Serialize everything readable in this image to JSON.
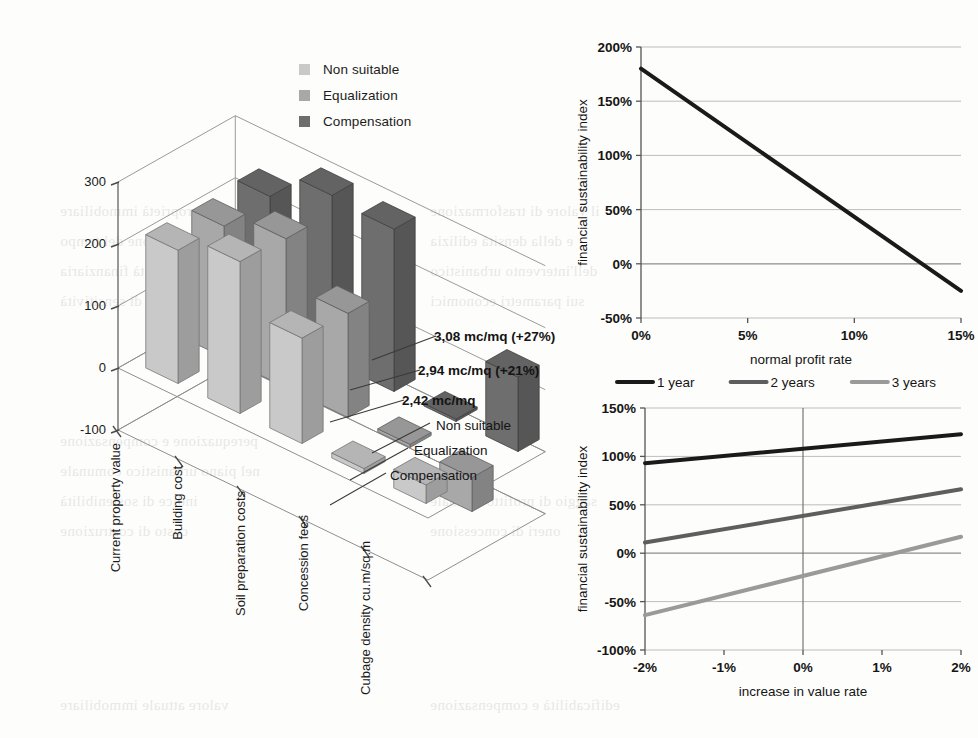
{
  "page": {
    "background_color": "#fdfdfb",
    "bleed_text": [
      {
        "t": "della proprietà immobiliare",
        "x": 60,
        "y": 196
      },
      {
        "t": "il valore di trasformazione",
        "x": 430,
        "y": 196
      },
      {
        "t": "in funzione del tempo",
        "x": 60,
        "y": 226
      },
      {
        "t": "e della densità edilizia",
        "x": 430,
        "y": 226
      },
      {
        "t": "La sostenibilità finanziaria",
        "x": 60,
        "y": 256
      },
      {
        "t": "dell'intervento urbanistico",
        "x": 430,
        "y": 256
      },
      {
        "t": "analisi di sensitività",
        "x": 60,
        "y": 286
      },
      {
        "t": "sui parametri economici",
        "x": 430,
        "y": 286
      },
      {
        "t": "perequazione e compensazione",
        "x": 60,
        "y": 426
      },
      {
        "t": "nel piano urbanistico comunale",
        "x": 60,
        "y": 456
      },
      {
        "t": "indice di sostenibilità",
        "x": 60,
        "y": 486
      },
      {
        "t": "saggio di profitto normale",
        "x": 430,
        "y": 486
      },
      {
        "t": "costo di costruzione",
        "x": 60,
        "y": 516
      },
      {
        "t": "oneri di concessione",
        "x": 430,
        "y": 516
      },
      {
        "t": "valore attuale immobiliare",
        "x": 60,
        "y": 690
      },
      {
        "t": "edificabilità e compensazione",
        "x": 430,
        "y": 690
      }
    ]
  },
  "bar_chart": {
    "legend": [
      {
        "label": "Non suitable",
        "color": "#c9c9c9"
      },
      {
        "label": "Equalization",
        "color": "#a8a8a8"
      },
      {
        "label": "Compensation",
        "color": "#6e6e6e"
      }
    ],
    "depth_labels": [
      "Non suitable",
      "Equalization",
      "Compensation"
    ],
    "annotations": [
      {
        "text": "3,08 mc/mq (+27%)"
      },
      {
        "text": "2,94 mc/mq (+21%)"
      },
      {
        "text": "2,42 mc/mq"
      }
    ],
    "chart_data": {
      "type": "bar",
      "title": "",
      "xlabel": "",
      "ylabel": "",
      "ylim": [
        -100,
        300
      ],
      "yticks": [
        -100,
        0,
        100,
        200,
        300
      ],
      "grid": true,
      "categories": [
        "Current property value",
        "Building cost",
        "Soil preparation costs",
        "Concession fees",
        "Cubage density cu.m/sq.m"
      ],
      "series": [
        {
          "name": "Non suitable",
          "color": "#c9c9c9",
          "values": [
            215,
            245,
            170,
            8,
            30
          ]
        },
        {
          "name": "Equalization",
          "color": "#a8a8a8",
          "values": [
            212,
            240,
            168,
            5,
            -55
          ]
        },
        {
          "name": "Compensation",
          "color": "#6e6e6e",
          "values": [
            218,
            268,
            262,
            4,
            120
          ]
        }
      ]
    }
  },
  "line_chart_top": {
    "chart_data": {
      "type": "line",
      "title": "",
      "xlabel": "normal profit rate",
      "ylabel": "financial sustainability index",
      "xlim": [
        0,
        15
      ],
      "ylim": [
        -50,
        200
      ],
      "xticks": [
        0,
        5,
        10,
        15
      ],
      "xticklabels": [
        "0%",
        "5%",
        "10%",
        "15%"
      ],
      "yticks": [
        -50,
        0,
        50,
        100,
        150,
        200
      ],
      "yticklabels": [
        "-50%",
        "0%",
        "50%",
        "100%",
        "150%",
        "200%"
      ],
      "grid": true,
      "legend": "none",
      "series": [
        {
          "name": "sustainability",
          "color": "#1a1a1a",
          "x": [
            0,
            15
          ],
          "y": [
            180,
            -25
          ]
        }
      ]
    }
  },
  "line_chart_bottom": {
    "chart_data": {
      "type": "line",
      "title": "",
      "xlabel": "increase in value rate",
      "ylabel": "financial sustainability index",
      "xlim": [
        -2,
        2
      ],
      "ylim": [
        -100,
        150
      ],
      "xticks": [
        -2,
        -1,
        0,
        1,
        2
      ],
      "xticklabels": [
        "-2%",
        "-1%",
        "0%",
        "1%",
        "2%"
      ],
      "yticks": [
        -100,
        -50,
        0,
        50,
        100,
        150
      ],
      "yticklabels": [
        "-100%",
        "-50%",
        "0%",
        "50%",
        "100%",
        "150%"
      ],
      "grid": true,
      "legend": "top",
      "series": [
        {
          "name": "1 year",
          "color": "#1a1a1a",
          "x": [
            -2,
            2
          ],
          "y": [
            93,
            123
          ]
        },
        {
          "name": "2 years",
          "color": "#5e5e5e",
          "x": [
            -2,
            2
          ],
          "y": [
            11,
            66
          ]
        },
        {
          "name": "3 years",
          "color": "#9a9a9a",
          "x": [
            -2,
            2
          ],
          "y": [
            -64,
            17
          ]
        }
      ]
    }
  }
}
